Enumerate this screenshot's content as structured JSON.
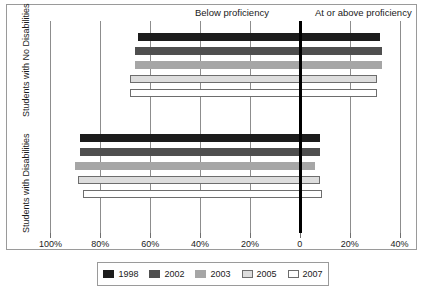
{
  "chart_data": {
    "type": "bar",
    "title": "",
    "subtitle": "",
    "orientation": "horizontal",
    "style": "diverging-bidirectional",
    "xlabel": "",
    "ylabel": "",
    "grid": true,
    "legend_position": "bottom",
    "axis": {
      "zero_label": "0",
      "zero_value": 0,
      "left_direction_label": "Below proficiency",
      "right_direction_label": "At or above proficiency",
      "tick_labels": [
        "100%",
        "80%",
        "60%",
        "40%",
        "20%",
        "0",
        "20%",
        "40%"
      ],
      "tick_values": [
        -100,
        -80,
        -60,
        -40,
        -20,
        0,
        20,
        40
      ],
      "xlim": [
        -105,
        45
      ]
    },
    "groups": [
      {
        "name": "Students with No Disabilities",
        "label": "Students with No Disabilities",
        "bars": [
          {
            "series": "1998",
            "below": 65,
            "above": 32
          },
          {
            "series": "2002",
            "below": 66,
            "above": 33
          },
          {
            "series": "2003",
            "below": 66,
            "above": 33
          },
          {
            "series": "2005",
            "below": 68,
            "above": 31
          },
          {
            "series": "2007",
            "below": 68,
            "above": 31
          }
        ]
      },
      {
        "name": "Students with Disabilities",
        "label": "Students with Disabilities",
        "bars": [
          {
            "series": "1998",
            "below": 88,
            "above": 8
          },
          {
            "series": "2002",
            "below": 88,
            "above": 8
          },
          {
            "series": "2003",
            "below": 90,
            "above": 6
          },
          {
            "series": "2005",
            "below": 89,
            "above": 8
          },
          {
            "series": "2007",
            "below": 87,
            "above": 9
          }
        ]
      }
    ],
    "series": [
      {
        "name": "1998",
        "color": "#1c1c1c",
        "outlined": false
      },
      {
        "name": "2002",
        "color": "#4f4f4f",
        "outlined": false
      },
      {
        "name": "2003",
        "color": "#a6a6a6",
        "outlined": false
      },
      {
        "name": "2005",
        "color": "#dddddd",
        "outlined": true
      },
      {
        "name": "2007",
        "color": "#ffffff",
        "outlined": true
      }
    ]
  },
  "legend": {
    "entries": [
      {
        "label": "1998",
        "color": "#1c1c1c"
      },
      {
        "label": "2002",
        "color": "#4f4f4f"
      },
      {
        "label": "2003",
        "color": "#a6a6a6"
      },
      {
        "label": "2005",
        "color": "#dddddd"
      },
      {
        "label": "2007",
        "color": "#ffffff"
      }
    ]
  }
}
